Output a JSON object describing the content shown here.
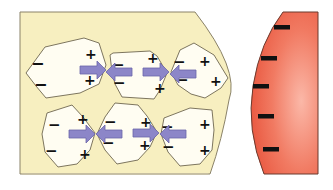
{
  "diagram": {
    "colors": {
      "background": "#ffffff",
      "material_fill": "#f7efc0",
      "material_stroke": "#8a8268",
      "particle_fill": "#fffdf2",
      "particle_stroke": "#6e6650",
      "arrow_fill": "#8c86c8",
      "arrow_stroke": "#6b64a8",
      "charge_color": "#111111",
      "body_fill_light": "#fbb8a8",
      "body_fill_dark": "#e8553d",
      "body_stroke": "#6b3a2e"
    },
    "symbols": {
      "plus": "+",
      "minus": "−"
    },
    "material": {
      "label": "yellow-material-block",
      "particles": [
        {
          "id": "p1",
          "row": 1,
          "left_charges": [
            "−",
            "−"
          ],
          "right_charges": [
            "+",
            "+"
          ]
        },
        {
          "id": "p2",
          "row": 1,
          "left_charges": [
            "−",
            "−"
          ],
          "right_charges": [
            "+",
            "+"
          ]
        },
        {
          "id": "p3",
          "row": 1,
          "left_charges": [
            "−",
            "−"
          ],
          "right_charges": [
            "+",
            "+"
          ]
        },
        {
          "id": "p4",
          "row": 2,
          "left_charges": [
            "−",
            "−"
          ],
          "right_charges": [
            "+",
            "+"
          ]
        },
        {
          "id": "p5",
          "row": 2,
          "left_charges": [
            "−",
            "−"
          ],
          "right_charges": [
            "+",
            "+"
          ]
        },
        {
          "id": "p6",
          "row": 2,
          "left_charges": [
            "−",
            "−"
          ],
          "right_charges": [
            "+",
            "+"
          ]
        }
      ],
      "arrow_pairs": 4
    },
    "charged_body": {
      "label": "red-charged-body",
      "charge_marks": [
        "−",
        "−",
        "−",
        "−",
        "−"
      ]
    }
  }
}
